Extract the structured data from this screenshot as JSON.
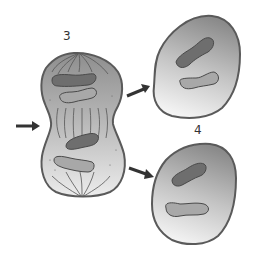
{
  "figure": {
    "type": "cell-division-illustration",
    "stage_labels": {
      "dividing_cell": "3",
      "daughter_cells": "4"
    },
    "colors": {
      "background": "#ffffff",
      "cell_outline": "#5a5a5a",
      "cytoplasm_dark": "#8c8c8c",
      "cytoplasm_light": "#f2f2f2",
      "chromosome_dark": "#6e6e6e",
      "chromosome_light": "#a8a8a8",
      "spindle_fiber": "#555555",
      "arrow": "#333333"
    },
    "arrows": [
      {
        "name": "cleavage-furrow-arrow",
        "points_to": "dividing cell midline"
      },
      {
        "name": "upper-daughter-arrow",
        "points_to": "upper daughter cell"
      },
      {
        "name": "lower-daughter-arrow",
        "points_to": "lower daughter cell"
      }
    ]
  }
}
